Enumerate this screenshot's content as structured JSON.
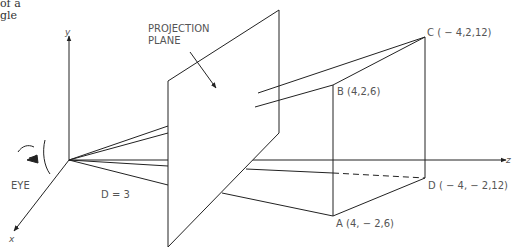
{
  "page_fragment": {
    "line1": "of a",
    "line2": "gle"
  },
  "axes": {
    "x": "x",
    "y": "y",
    "z": "z"
  },
  "labels": {
    "plane_line1": "PROJECTION",
    "plane_line2": "PLANE",
    "eye": "EYE",
    "distance": "D = 3"
  },
  "points": {
    "A": "A (4, − 2,6)",
    "B": "B (4,2,6)",
    "C": "C ( − 4,2,12)",
    "D": "D ( − 4, − 2,12)"
  },
  "colors": {
    "line": "#222222",
    "text": "#555555"
  }
}
